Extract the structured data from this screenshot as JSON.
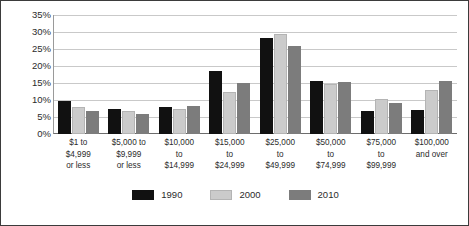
{
  "chart_data": {
    "type": "bar",
    "title": "",
    "xlabel": "",
    "ylabel": "",
    "ylim": [
      0,
      35
    ],
    "ytick_step": 5,
    "grid": true,
    "legend_position": "bottom",
    "ytick_labels": [
      "35%",
      "30%",
      "25%",
      "20%",
      "15%",
      "10%",
      "5%",
      "0%"
    ],
    "ytick_values": [
      35,
      30,
      25,
      20,
      15,
      10,
      5,
      0
    ],
    "categories": [
      "$1 to\n$4,999\nor less",
      "$5,000 to\n$9,999\nor less",
      "$10,000\nto\n$14,999",
      "$15,000\nto\n$24,999",
      "$25,000\nto\n$49,999",
      "$50,000\nto\n$74,999",
      "$75,000\nto\n$99,999",
      "$100,000\nand over"
    ],
    "series": [
      {
        "name": "1990",
        "color": "#111111",
        "values": [
          9.8,
          7.4,
          7.9,
          18.5,
          28.2,
          15.5,
          6.9,
          7.2
        ]
      },
      {
        "name": "2000",
        "color": "#cbcbcb",
        "values": [
          8.0,
          6.7,
          7.4,
          12.3,
          29.4,
          14.6,
          10.4,
          12.9
        ]
      },
      {
        "name": "2010",
        "color": "#7c7c7c",
        "values": [
          6.9,
          5.9,
          8.3,
          14.9,
          25.9,
          15.4,
          9.1,
          15.6
        ]
      }
    ]
  },
  "legend": {
    "items": [
      {
        "label": "1990"
      },
      {
        "label": "2000"
      },
      {
        "label": "2010"
      }
    ]
  },
  "colors": {
    "series_1990": "#111111",
    "series_2000": "#cbcbcb",
    "series_2010": "#7c7c7c",
    "gridline": "#c9c9c9",
    "axis": "#6d6d6d",
    "border": "#3b3b3b",
    "text": "#2b2b2b",
    "background": "#ffffff"
  }
}
